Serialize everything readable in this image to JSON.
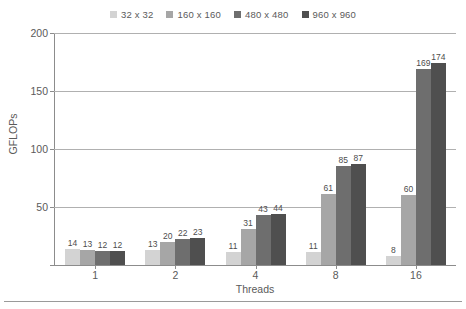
{
  "chart_data": {
    "type": "bar",
    "title": "",
    "xlabel": "Threads",
    "ylabel": "GFLOPs",
    "categories": [
      "1",
      "2",
      "4",
      "8",
      "16"
    ],
    "series": [
      {
        "name": "32 x 32",
        "color": "#d3d3d3",
        "values": [
          14,
          13,
          11,
          11,
          8
        ]
      },
      {
        "name": "160 x 160",
        "color": "#a6a6a6",
        "values": [
          13,
          20,
          31,
          61,
          60
        ]
      },
      {
        "name": "480 x 480",
        "color": "#6e6e6e",
        "values": [
          12,
          22,
          43,
          85,
          169
        ]
      },
      {
        "name": "960 x 960",
        "color": "#4f4f4f",
        "values": [
          12,
          23,
          44,
          87,
          174
        ]
      }
    ],
    "ylim": [
      0,
      200
    ],
    "yticks": [
      0,
      50,
      100,
      150,
      200
    ],
    "ytick_labels": [
      "",
      "50",
      "100",
      "150",
      "200"
    ],
    "grid": "horizontal",
    "legend_position": "top-center",
    "data_labels": true
  }
}
